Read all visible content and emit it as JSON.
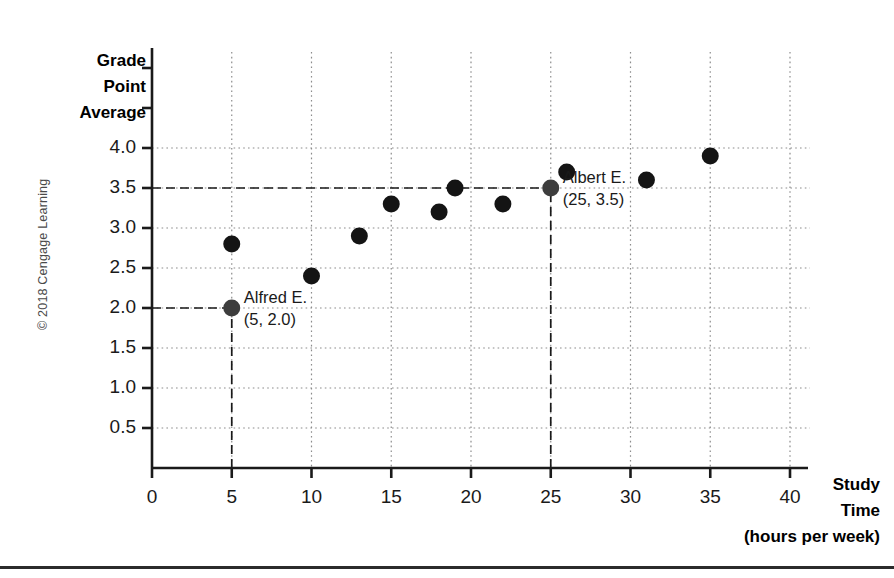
{
  "figure": {
    "copyright": "© 2018 Cengage Learning"
  },
  "axes": {
    "y_title_lines": [
      "Grade",
      "Point",
      "Average"
    ],
    "x_title_lines": [
      "Study",
      "Time",
      "(hours per week)"
    ],
    "y_ticks": [
      "0.5",
      "1.0",
      "1.5",
      "2.0",
      "2.5",
      "3.0",
      "3.5",
      "4.0"
    ],
    "x_ticks": [
      "0",
      "5",
      "10",
      "15",
      "20",
      "25",
      "30",
      "35",
      "40"
    ]
  },
  "annotations": [
    {
      "name": "Alfred E.",
      "coord": "(5, 2.0)",
      "x": 5,
      "y": 2.0
    },
    {
      "name": "Albert E.",
      "coord": "(25, 3.5)",
      "x": 25,
      "y": 3.5
    }
  ],
  "colors": {
    "marker": "#141414",
    "axis": "#1a1a1a",
    "grid": "#8c8c8c",
    "guide": "#1a1a1a",
    "text": "#1a1a1a",
    "copyright": "#4a4a4a"
  },
  "chart_data": {
    "type": "scatter",
    "title": "",
    "xlabel": "Study Time (hours per week)",
    "ylabel": "Grade Point Average",
    "xlim": [
      0,
      40
    ],
    "ylim": [
      0,
      4.5
    ],
    "xticks": [
      0,
      5,
      10,
      15,
      20,
      25,
      30,
      35,
      40
    ],
    "yticks": [
      0.5,
      1.0,
      1.5,
      2.0,
      2.5,
      3.0,
      3.5,
      4.0
    ],
    "grid": true,
    "legend": "none",
    "series": [
      {
        "name": "Students",
        "points": [
          {
            "x": 5,
            "y": 2.0,
            "label": "Alfred E."
          },
          {
            "x": 5,
            "y": 2.8,
            "label": ""
          },
          {
            "x": 10,
            "y": 2.4,
            "label": ""
          },
          {
            "x": 13,
            "y": 2.9,
            "label": ""
          },
          {
            "x": 15,
            "y": 3.3,
            "label": ""
          },
          {
            "x": 18,
            "y": 3.2,
            "label": ""
          },
          {
            "x": 19,
            "y": 3.5,
            "label": ""
          },
          {
            "x": 22,
            "y": 3.3,
            "label": ""
          },
          {
            "x": 25,
            "y": 3.5,
            "label": "Albert E."
          },
          {
            "x": 26,
            "y": 3.7,
            "label": ""
          },
          {
            "x": 31,
            "y": 3.6,
            "label": ""
          },
          {
            "x": 35,
            "y": 3.9,
            "label": ""
          }
        ]
      }
    ],
    "guide_lines": [
      {
        "from": [
          0,
          2.0
        ],
        "to": [
          5,
          2.0
        ],
        "style": "dashed",
        "axis": "horizontal"
      },
      {
        "from": [
          5,
          0
        ],
        "to": [
          5,
          2.0
        ],
        "style": "dashed",
        "axis": "vertical"
      },
      {
        "from": [
          0,
          3.5
        ],
        "to": [
          25,
          3.5
        ],
        "style": "dashed",
        "axis": "horizontal"
      },
      {
        "from": [
          25,
          0
        ],
        "to": [
          25,
          3.5
        ],
        "style": "dashed",
        "axis": "vertical"
      }
    ]
  }
}
